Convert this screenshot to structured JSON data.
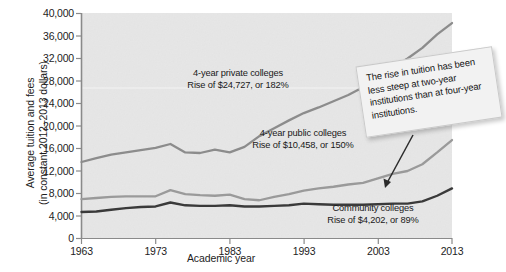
{
  "chart_data": {
    "type": "line",
    "title": "",
    "xlabel": "Academic year",
    "ylabel": "Average tuition and fees (in constant 2012–2013 dollars)",
    "ylabel_line1": "Average tuition and fees",
    "ylabel_line2": "(in constant 2012–2013 dollars)",
    "xlim": [
      1963,
      2013
    ],
    "ylim": [
      0,
      40000
    ],
    "grid": false,
    "legend_position": "inline-annotations",
    "yticks": [
      "0",
      "4,000",
      "8,000",
      "12,000",
      "16,000",
      "20,000",
      "24,000",
      "28,000",
      "32,000",
      "36,000",
      "40,000"
    ],
    "ytick_values": [
      0,
      4000,
      8000,
      12000,
      16000,
      20000,
      24000,
      28000,
      32000,
      36000,
      40000
    ],
    "xticks": [
      "1963",
      "1973",
      "1983",
      "1993",
      "2003",
      "2013"
    ],
    "xtick_values": [
      1963,
      1973,
      1983,
      1993,
      2003,
      2013
    ],
    "colors": {
      "private": "#8c8c8c",
      "public": "#9a9a9a",
      "community": "#3a3a3a",
      "plot_background": "#e7e7e7",
      "axis": "#8a8a8a",
      "callout_background": "#f2f2f2"
    },
    "x": [
      1963,
      1965,
      1967,
      1969,
      1971,
      1973,
      1975,
      1977,
      1979,
      1981,
      1983,
      1985,
      1987,
      1989,
      1991,
      1993,
      1995,
      1997,
      1999,
      2001,
      2003,
      2005,
      2007,
      2009,
      2011,
      2013
    ],
    "series": [
      {
        "name": "4-year private colleges",
        "color": "#8c8c8c",
        "values": [
          13600,
          14300,
          14900,
          15300,
          15700,
          16100,
          16800,
          15300,
          15200,
          15800,
          15300,
          16300,
          18200,
          19600,
          21000,
          22300,
          23300,
          24400,
          25500,
          26900,
          28700,
          30300,
          32000,
          33900,
          36300,
          38300
        ]
      },
      {
        "name": "4-year public colleges",
        "color": "#9a9a9a",
        "values": [
          7000,
          7200,
          7400,
          7500,
          7500,
          7500,
          8600,
          7900,
          7700,
          7600,
          7800,
          7000,
          6800,
          7400,
          7900,
          8500,
          8900,
          9200,
          9600,
          9900,
          10700,
          11500,
          12000,
          13200,
          15300,
          17500
        ]
      },
      {
        "name": "Community colleges",
        "color": "#3a3a3a",
        "values": [
          4700,
          4800,
          5100,
          5400,
          5600,
          5700,
          6400,
          5900,
          5800,
          5800,
          5900,
          5700,
          5700,
          5800,
          5900,
          6200,
          6100,
          6000,
          6000,
          6000,
          6100,
          6200,
          6200,
          6600,
          7600,
          8900
        ]
      }
    ],
    "annotations": [
      {
        "id": "private-note",
        "line1": "4-year private colleges",
        "line2": "Rise of $24,727, or 182%"
      },
      {
        "id": "public-note",
        "line1": "4-year public colleges",
        "line2": "Rise of $10,458, or 150%"
      },
      {
        "id": "community-note",
        "line1": "Community colleges",
        "line2": "Rise of $4,202, or 89%"
      }
    ],
    "callout": {
      "text": "The rise in tuition has been less steep at two-year institutions than at four-year institutions."
    }
  }
}
